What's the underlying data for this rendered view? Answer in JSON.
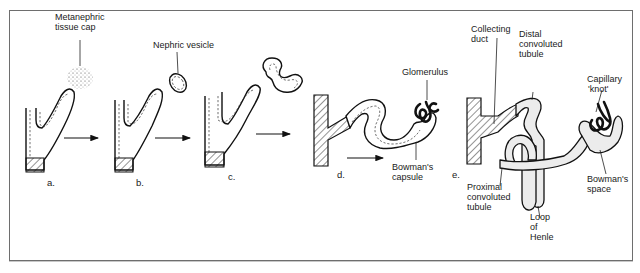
{
  "figure": {
    "type": "diagram",
    "stages": [
      {
        "id": "a",
        "label": "a.",
        "annotations": [
          "Metanephric tissue cap"
        ]
      },
      {
        "id": "b",
        "label": "b.",
        "annotations": [
          "Nephric vesicle"
        ]
      },
      {
        "id": "c",
        "label": "c.",
        "annotations": []
      },
      {
        "id": "d",
        "label": "d.",
        "annotations": [
          "Glomerulus",
          "Bowman's capsule"
        ]
      },
      {
        "id": "e",
        "label": "e.",
        "annotations": [
          "Collecting duct",
          "Distal convoluted tubule",
          "Capillary 'knot'",
          "Bowman's space",
          "Proximal convoluted tubule",
          "Loop of Henle"
        ]
      }
    ]
  },
  "labels": {
    "metanephric_1": "Metanephric",
    "metanephric_2": "tissue cap",
    "nephric_vesicle": "Nephric vesicle",
    "glomerulus": "Glomerulus",
    "bowmans_capsule_1": "Bowman's",
    "bowmans_capsule_2": "capsule",
    "collecting_1": "Collecting",
    "collecting_2": "duct",
    "distal_1": "Distal",
    "distal_2": "convoluted",
    "distal_3": "tubule",
    "capillary_1": "Capillary",
    "capillary_2": "'knot'",
    "bowmans_space_1": "Bowman's",
    "bowmans_space_2": "space",
    "proximal_1": "Proximal",
    "proximal_2": "convoluted",
    "proximal_3": "tubule",
    "loop_1": "Loop",
    "loop_2": "of",
    "loop_3": "Henle"
  },
  "stage_labels": {
    "a": "a.",
    "b": "b.",
    "c": "c.",
    "d": "d.",
    "e": "e."
  },
  "colors": {
    "ink": "#111111",
    "frame": "#6e6e6e",
    "stipple": "#ececec",
    "background": "#ffffff"
  }
}
